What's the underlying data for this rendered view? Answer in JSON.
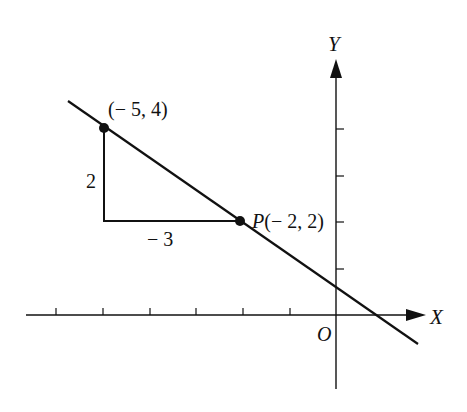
{
  "diagram": {
    "type": "coordinate-plane-slope",
    "axes": {
      "x_label": "X",
      "y_label": "Y",
      "origin_label": "O",
      "x_ticks": [
        -6,
        -5,
        -4,
        -3,
        -2,
        -1
      ],
      "y_ticks": [
        1,
        2,
        3,
        4
      ]
    },
    "points": [
      {
        "name": "point-a",
        "label": "(− 5, 4)",
        "x": -5,
        "y": 4
      },
      {
        "name": "point-p",
        "label_prefix": "P",
        "label": "(− 2, 2)",
        "x": -2,
        "y": 2
      }
    ],
    "triangle": {
      "rise_label": "2",
      "run_label": "− 3"
    },
    "line": {
      "slope": -0.6667,
      "passes_through": [
        [
          -5,
          4
        ],
        [
          -2,
          2
        ]
      ]
    }
  },
  "colors": {
    "ink": "#111111",
    "background": "#ffffff"
  }
}
